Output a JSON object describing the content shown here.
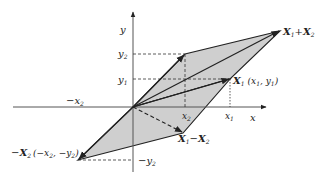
{
  "diagram": {
    "fill_color": "#cfcfcf",
    "line_color": "#222222",
    "axes": {
      "x_label": "x",
      "y_label": "y"
    },
    "ticks": {
      "x2": "x",
      "x2_sub": "2",
      "x1": "x",
      "x1_sub": "1",
      "neg_x2": "−x",
      "neg_x2_sub": "2",
      "y2": "y",
      "y2_sub": "2",
      "y1": "y",
      "y1_sub": "1",
      "neg_y2": "−y",
      "neg_y2_sub": "2"
    },
    "vectors": {
      "sum": {
        "main": "X",
        "sub1": "1",
        "op": "+",
        "main2": "X",
        "sub2": "2"
      },
      "x1": {
        "main": "X",
        "sub": "1",
        "coords": "(x",
        "coords_sub1": "1",
        "coords_mid": ", y",
        "coords_sub2": "1",
        "coords_end": ")"
      },
      "diff": {
        "main": "X",
        "sub1": "1",
        "op": "−",
        "main2": "X",
        "sub2": "2"
      },
      "neg_x2": {
        "prefix": "−",
        "main": "X",
        "sub": "2",
        "coords": "(−x",
        "coords_sub1": "2",
        "coords_mid": ", −y",
        "coords_sub2": "2",
        "coords_end": ")"
      }
    }
  }
}
